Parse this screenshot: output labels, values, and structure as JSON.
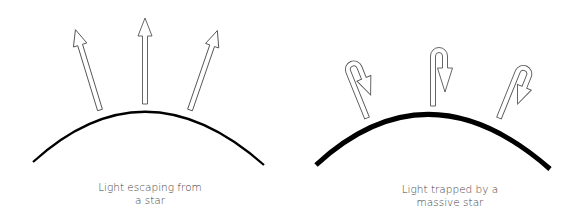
{
  "panels": [
    {
      "id": "left",
      "caption_line1": "Light escaping from",
      "caption_line2": "a star",
      "star_surface_stroke": 2.2,
      "arrow_type": "straight-outward",
      "arrow_count": 3
    },
    {
      "id": "right",
      "caption_line1": "Light trapped by a",
      "caption_line2": "massive star",
      "star_surface_stroke": 5,
      "arrow_type": "hooked-return",
      "arrow_count": 3
    }
  ],
  "colors": {
    "surface": "#000000",
    "arrow_outline": "#555555",
    "arrow_fill": "#ffffff",
    "caption": "#444444"
  }
}
